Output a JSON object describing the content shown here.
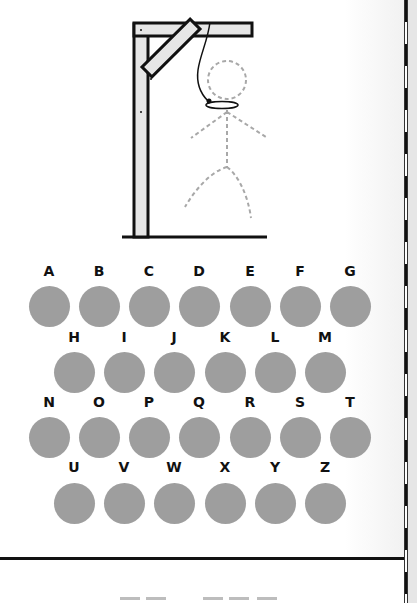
{
  "game": {
    "title": "Hangman",
    "figure": "gallows-with-dashed-stick-figure",
    "colors": {
      "letter_button": "#9e9e9e",
      "letter_text": "#111111",
      "gallows_wood": "#e6e6e6",
      "gallows_outline": "#111111",
      "figure_dashes": "#a8a8a8"
    }
  },
  "keyboard": {
    "rows": [
      [
        "A",
        "B",
        "C",
        "D",
        "E",
        "F",
        "G"
      ],
      [
        "H",
        "I",
        "J",
        "K",
        "L",
        "M"
      ],
      [
        "N",
        "O",
        "P",
        "Q",
        "R",
        "S",
        "T"
      ],
      [
        "U",
        "V",
        "W",
        "X",
        "Y",
        "Z"
      ]
    ]
  },
  "word": {
    "blanks": [
      2,
      3
    ]
  }
}
